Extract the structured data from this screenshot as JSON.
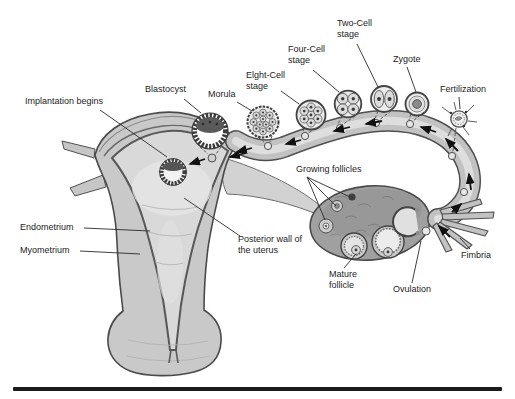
{
  "figure": {
    "type": "anatomy-diagram"
  },
  "labels": {
    "implantation": "Implantation begins",
    "blastocyst": "Blastocyst",
    "morula": "Morula",
    "eight_cell": "Elght-Cell stage",
    "four_cell": "Four-Cell stage",
    "two_cell": "Two-Cell stage",
    "zygote": "Zygote",
    "fertilization": "Fertilization",
    "growing_follicles": "Growing follicles",
    "endometrium": "Endometrium",
    "myometrium": "Myometrium",
    "posterior_wall": "Posterior wall of the uterus",
    "mature_follicle": "Mature follicle",
    "ovulation": "Ovulation",
    "fimbria": "Fimbria"
  },
  "colors": {
    "background": "#ffffff",
    "ink": "#1c1c1c",
    "outline": "#4a4a4a",
    "organ_fill": "#c9c9c9",
    "cavity_fill": "#dcdcdc",
    "tube_fill": "#c2c2c2",
    "ovary_fill": "#9d9d9d",
    "bottom_rule": "#1c1c1c"
  }
}
